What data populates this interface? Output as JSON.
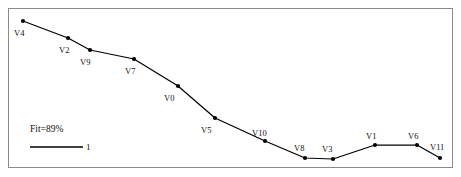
{
  "figure": {
    "background_color": "#ffffff",
    "frame_color": "#8a8a8a",
    "line_color": "#000000",
    "marker_color": "#000000",
    "text_color": "#111111"
  },
  "annotations": {
    "fit_label": "Fit=89%",
    "legend_key_label": "1"
  },
  "chart_data": {
    "type": "line",
    "title": "",
    "subtitle": "",
    "xlabel": "",
    "ylabel": "",
    "grid": false,
    "legend_position": "lower-left",
    "xlim": [
      0,
      11
    ],
    "ylim": [
      0,
      1
    ],
    "axis_ticks_visible": false,
    "annotations": [
      "Fit=89%"
    ],
    "legend": [
      {
        "name": "1",
        "style": "solid-black-line"
      }
    ],
    "point_labels": [
      "V4",
      "V2",
      "V9",
      "V7",
      "V0",
      "V5",
      "V10",
      "V8",
      "V3",
      "V1",
      "V6",
      "V11"
    ],
    "x": [
      0,
      1,
      2,
      3,
      4,
      5,
      6,
      7,
      8,
      9,
      10,
      11
    ],
    "values": [
      0.955,
      0.855,
      0.78,
      0.69,
      0.52,
      0.33,
      0.19,
      0.085,
      0.08,
      0.165,
      0.16,
      0.09
    ],
    "series": [
      {
        "name": "1",
        "values": [
          0.955,
          0.855,
          0.78,
          0.69,
          0.52,
          0.33,
          0.19,
          0.085,
          0.08,
          0.165,
          0.16,
          0.09
        ]
      }
    ],
    "points_px": [
      {
        "label": "V4",
        "x": 23,
        "y": 21,
        "lx": 14,
        "ly": 36
      },
      {
        "label": "V2",
        "x": 68,
        "y": 38,
        "lx": 59,
        "ly": 53
      },
      {
        "label": "V9",
        "x": 90,
        "y": 50,
        "lx": 80,
        "ly": 65
      },
      {
        "label": "V7",
        "x": 134,
        "y": 59,
        "lx": 125,
        "ly": 74
      },
      {
        "label": "V0",
        "x": 178,
        "y": 86,
        "lx": 164,
        "ly": 101
      },
      {
        "label": "V5",
        "x": 215,
        "y": 118,
        "lx": 201,
        "ly": 133
      },
      {
        "label": "V10",
        "x": 265,
        "y": 141,
        "lx": 252,
        "ly": 136
      },
      {
        "label": "V8",
        "x": 305,
        "y": 158,
        "lx": 294,
        "ly": 151
      },
      {
        "label": "V3",
        "x": 333,
        "y": 159,
        "lx": 322,
        "ly": 152
      },
      {
        "label": "V1",
        "x": 375,
        "y": 145,
        "lx": 366,
        "ly": 139
      },
      {
        "label": "V6",
        "x": 417,
        "y": 145,
        "lx": 408,
        "ly": 139
      },
      {
        "label": "V11",
        "x": 440,
        "y": 158,
        "lx": 430,
        "ly": 150
      }
    ],
    "legend_line_px": {
      "x1": 30,
      "x2": 83,
      "y": 147,
      "label_x": 86,
      "label_y": 150
    },
    "fit_label_px": {
      "x": 30,
      "y": 132
    }
  }
}
